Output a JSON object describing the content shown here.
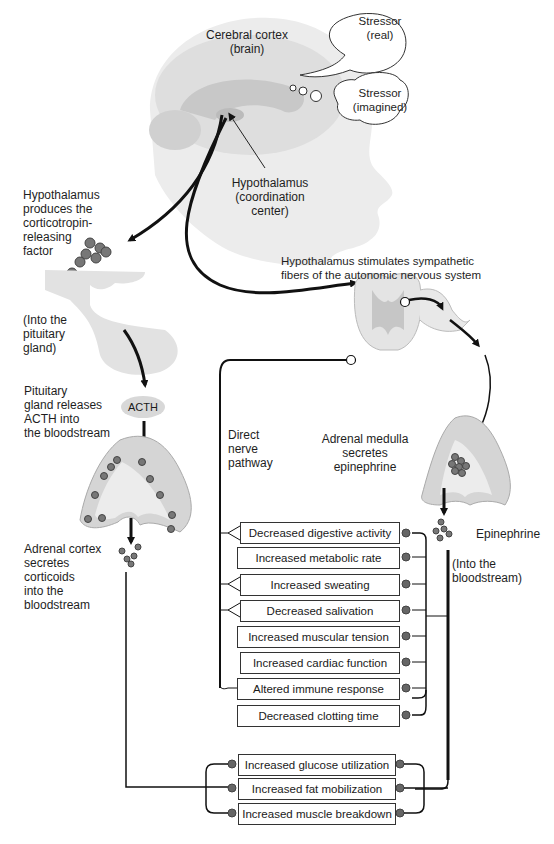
{
  "diagram": {
    "labels": {
      "cerebral_cortex": "Cerebral cortex\n(brain)",
      "cerebral_cortex_line1": "Cerebral cortex",
      "cerebral_cortex_line2": "(brain)",
      "stressor_real_line1": "Stressor",
      "stressor_real_line2": "(real)",
      "stressor_imagined_line1": "Stressor",
      "stressor_imagined_line2": "(imagined)",
      "hypothalamus_line1": "Hypothalamus",
      "hypothalamus_line2": "(coordination",
      "hypothalamus_line3": "center)",
      "crf_line1": "Hypothalamus",
      "crf_line2": "produces the",
      "crf_line3": "corticotropin-",
      "crf_line4": "releasing",
      "crf_line5": "factor",
      "pituitary_in_line1": "(Into the",
      "pituitary_in_line2": "pituitary",
      "pituitary_in_line3": "gland)",
      "pituitary_rel_line1": "Pituitary",
      "pituitary_rel_line2": "gland releases",
      "pituitary_rel_line3": "ACTH into",
      "pituitary_rel_line4": "the bloodstream",
      "acth": "ACTH",
      "cortex_line1": "Adrenal cortex",
      "cortex_line2": "secretes",
      "cortex_line3": "corticoids",
      "cortex_line4": "into the",
      "cortex_line5": "bloodstream",
      "sympathetic_line1": "Hypothalamus stimulates sympathetic",
      "sympathetic_line2": "fibers of the autonomic nervous system",
      "direct_line1": "Direct",
      "direct_line2": "nerve",
      "direct_line3": "pathway",
      "medulla_line1": "Adrenal medulla",
      "medulla_line2": "secretes",
      "medulla_line3": "epinephrine",
      "epinephrine": "Epinephrine",
      "blood_line1": "(Into the",
      "blood_line2": "bloodstream)"
    },
    "effects": [
      {
        "label": "Decreased digestive activity",
        "nerve": true
      },
      {
        "label": "Increased metabolic rate",
        "nerve": false
      },
      {
        "label": "Increased sweating",
        "nerve": true
      },
      {
        "label": "Decreased salivation",
        "nerve": true
      },
      {
        "label": "Increased muscular tension",
        "nerve": false
      },
      {
        "label": "Increased cardiac function",
        "nerve": true
      },
      {
        "label": "Altered immune response",
        "nerve": false
      },
      {
        "label": "Decreased clotting time",
        "nerve": false
      }
    ],
    "corticoid_effects": [
      {
        "label": "Increased glucose utilization"
      },
      {
        "label": "Increased fat mobilization"
      },
      {
        "label": "Increased muscle breakdown"
      }
    ],
    "colors": {
      "line": "#111111",
      "tissue": "#dcdcdc",
      "tissue_dark": "#bdbdbd",
      "cell": "#6a6a6a"
    }
  }
}
